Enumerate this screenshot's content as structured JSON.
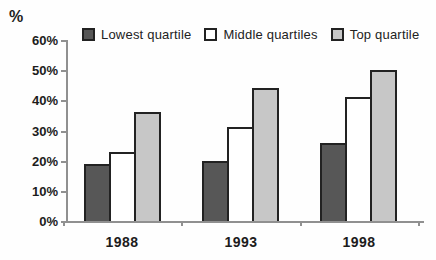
{
  "chart_data": {
    "type": "bar",
    "title": "",
    "xlabel": "",
    "ylabel": "%",
    "categories": [
      "1988",
      "1993",
      "1998"
    ],
    "series": [
      {
        "name": "Lowest quartile",
        "color": "#575757",
        "values": [
          19,
          20,
          26
        ]
      },
      {
        "name": "Middle quartiles",
        "color": "#ffffff",
        "values": [
          23,
          31,
          41
        ]
      },
      {
        "name": "Top quartile",
        "color": "#c7c7c7",
        "values": [
          36,
          44,
          50
        ]
      }
    ],
    "ylim": [
      0,
      60
    ],
    "ytick_step": 10,
    "ytick_labels": [
      "0%",
      "10%",
      "20%",
      "30%",
      "40%",
      "50%",
      "60%"
    ],
    "legend_position": "top",
    "grid": false,
    "colors": {
      "bar_border": "#222222",
      "axis": "#909090",
      "text": "#1a1a1a"
    }
  }
}
